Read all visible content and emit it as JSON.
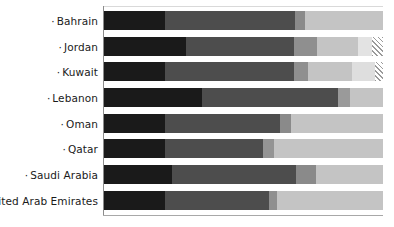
{
  "chart_data": {
    "type": "bar",
    "orientation": "horizontal",
    "stacked": true,
    "normalized": true,
    "title": "",
    "subtitle": "",
    "xlabel": "",
    "ylabel": "",
    "xlim": [
      0,
      100
    ],
    "grid": false,
    "legend_position": "none",
    "categories": [
      "Bahrain",
      "Jordan",
      "Kuwait",
      "Lebanon",
      "Oman",
      "Qatar",
      "Saudi Arabia",
      "United Arab Emirates"
    ],
    "series": [
      {
        "name": "segment-1",
        "color": "#1a1a1a",
        "values": [
          22,
          29,
          22,
          35,
          22,
          22,
          24,
          22
        ]
      },
      {
        "name": "segment-2",
        "color": "#4d4d4d",
        "values": [
          46,
          39,
          46,
          49,
          41,
          35,
          45,
          37
        ]
      },
      {
        "name": "segment-3",
        "color": "#808080",
        "values": [
          4,
          9,
          5,
          4,
          4,
          4,
          7,
          3
        ]
      },
      {
        "name": "segment-4",
        "color": "#c2c2c2",
        "values": [
          28,
          17,
          23,
          12,
          33,
          39,
          24,
          38
        ]
      },
      {
        "name": "segment-5",
        "color": "#e8e8e8",
        "values": [
          0,
          2,
          1,
          0,
          0,
          0,
          0,
          0
        ]
      },
      {
        "name": "segment-6-hatched",
        "color": "hatched",
        "values": [
          0,
          4,
          3,
          0,
          0,
          0,
          0,
          0
        ]
      }
    ]
  },
  "axis": {
    "tick_marker": "·"
  },
  "rows": [
    {
      "label": "Bahrain",
      "segments": [
        {
          "name": "s1",
          "color": "#1a1a1a",
          "width": 22.0
        },
        {
          "name": "s2",
          "color": "#4d4d4d",
          "width": 46.5
        },
        {
          "name": "s3",
          "color": "#8a8a8a",
          "width": 3.5
        },
        {
          "name": "s4",
          "color": "#c4c4c4",
          "width": 28.0
        }
      ]
    },
    {
      "label": "Jordan",
      "segments": [
        {
          "name": "s1",
          "color": "#1a1a1a",
          "width": 29.5
        },
        {
          "name": "s2",
          "color": "#4d4d4d",
          "width": 38.5
        },
        {
          "name": "s3",
          "color": "#8f8f8f",
          "width": 8.5
        },
        {
          "name": "s4",
          "color": "#c4c4c4",
          "width": 14.5
        },
        {
          "name": "s5",
          "color": "#e3e3e3",
          "width": 5.0
        },
        {
          "name": "s6",
          "color": "hatched",
          "width": 4.0
        }
      ]
    },
    {
      "label": "Kuwait",
      "segments": [
        {
          "name": "s1",
          "color": "#1a1a1a",
          "width": 22.0
        },
        {
          "name": "s2",
          "color": "#4d4d4d",
          "width": 46.0
        },
        {
          "name": "s3",
          "color": "#8f8f8f",
          "width": 5.0
        },
        {
          "name": "s4",
          "color": "#c4c4c4",
          "width": 16.0
        },
        {
          "name": "s5",
          "color": "#dedede",
          "width": 8.0
        },
        {
          "name": "s6",
          "color": "hatched",
          "width": 3.0
        }
      ]
    },
    {
      "label": "Lebanon",
      "segments": [
        {
          "name": "s1",
          "color": "#1a1a1a",
          "width": 35.0
        },
        {
          "name": "s2",
          "color": "#4d4d4d",
          "width": 49.0
        },
        {
          "name": "s3",
          "color": "#9a9a9a",
          "width": 4.0
        },
        {
          "name": "s4",
          "color": "#c4c4c4",
          "width": 12.0
        }
      ]
    },
    {
      "label": "Oman",
      "segments": [
        {
          "name": "s1",
          "color": "#1a1a1a",
          "width": 22.0
        },
        {
          "name": "s2",
          "color": "#4d4d4d",
          "width": 41.0
        },
        {
          "name": "s3",
          "color": "#8a8a8a",
          "width": 4.0
        },
        {
          "name": "s4",
          "color": "#c4c4c4",
          "width": 33.0
        }
      ]
    },
    {
      "label": "Qatar",
      "segments": [
        {
          "name": "s1",
          "color": "#1a1a1a",
          "width": 22.0
        },
        {
          "name": "s2",
          "color": "#4d4d4d",
          "width": 35.0
        },
        {
          "name": "s3",
          "color": "#949494",
          "width": 4.0
        },
        {
          "name": "s4",
          "color": "#c4c4c4",
          "width": 39.0
        }
      ]
    },
    {
      "label": "Saudi Arabia",
      "segments": [
        {
          "name": "s1",
          "color": "#1a1a1a",
          "width": 24.5
        },
        {
          "name": "s2",
          "color": "#4d4d4d",
          "width": 44.5
        },
        {
          "name": "s3",
          "color": "#8a8a8a",
          "width": 7.0
        },
        {
          "name": "s4",
          "color": "#c4c4c4",
          "width": 24.0
        }
      ]
    },
    {
      "label": "United Arab Emirates",
      "segments": [
        {
          "name": "s1",
          "color": "#1a1a1a",
          "width": 22.0
        },
        {
          "name": "s2",
          "color": "#4d4d4d",
          "width": 37.0
        },
        {
          "name": "s3",
          "color": "#8f8f8f",
          "width": 3.0
        },
        {
          "name": "s4",
          "color": "#c4c4c4",
          "width": 38.0
        }
      ]
    }
  ],
  "layout": {
    "row_top_offsets": [
      8,
      34,
      59,
      85,
      111,
      136,
      162,
      188
    ]
  }
}
